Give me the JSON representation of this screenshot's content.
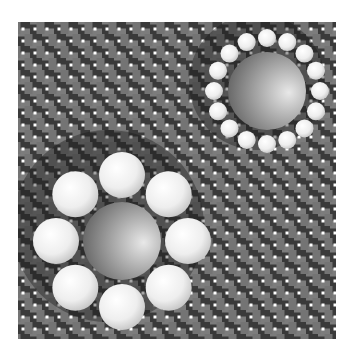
{
  "image": {
    "width": 354,
    "height": 354,
    "background": "#ffffff",
    "description": "Ebbinghaus illusion over a basket-weave background"
  },
  "background_pattern": {
    "type": "basket-weave",
    "x": 18,
    "y": 22,
    "width": 318,
    "height": 317,
    "cell": 12,
    "strand_color": "#7c7c7c",
    "outline_color": "#3a3a3a",
    "dot_color": "#ffffff"
  },
  "clusters": [
    {
      "name": "small-surround-cluster",
      "center": [
        267,
        91
      ],
      "shadow": {
        "cx": 257,
        "cy": 82,
        "r": 68
      },
      "center_sphere": {
        "r": 39
      },
      "surround": {
        "count": 16,
        "orbit": 53,
        "r": 9
      }
    },
    {
      "name": "large-surround-cluster",
      "center": [
        122,
        241
      ],
      "shadow": {
        "cx": 108,
        "cy": 226,
        "r": 96
      },
      "center_sphere": {
        "r": 39
      },
      "surround": {
        "count": 8,
        "orbit": 66,
        "r": 23
      }
    }
  ],
  "colors": {
    "center_sphere_dark": "#5e5e5e",
    "center_sphere_light": "#e4e4e4",
    "small_sphere_light": "#ffffff",
    "small_sphere_mid": "#ececec",
    "small_sphere_dark": "#b8b8b8",
    "shadow": "rgba(20,20,20,0.38)"
  }
}
